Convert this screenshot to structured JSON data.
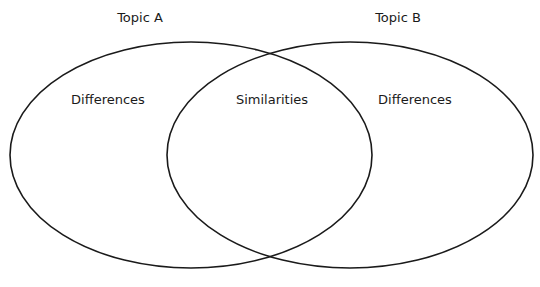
{
  "diagram": {
    "type": "venn",
    "stroke_color": "#1a1a1a",
    "background": "#ffffff",
    "sets": [
      {
        "id": "A",
        "title": "Topic A",
        "region_label": "Differences"
      },
      {
        "id": "B",
        "title": "Topic B",
        "region_label": "Differences"
      }
    ],
    "intersection": {
      "label": "Similarities"
    }
  }
}
